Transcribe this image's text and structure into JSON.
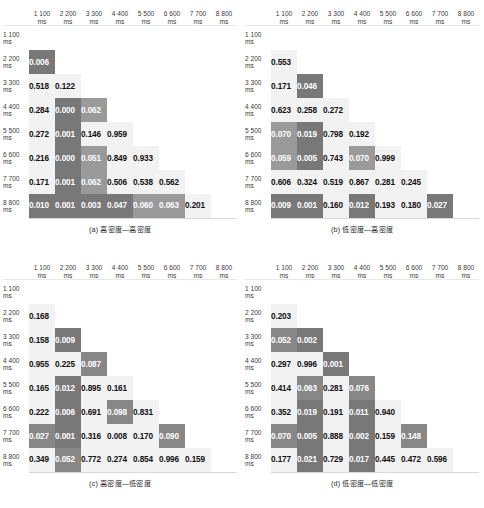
{
  "figure": {
    "type": "multi-panel-heatmap-matrix",
    "panels_count": 4
  },
  "axis": {
    "labels": [
      {
        "num": "1 100",
        "unit": "ms"
      },
      {
        "num": "2 200",
        "unit": "ms"
      },
      {
        "num": "3 300",
        "unit": "ms"
      },
      {
        "num": "4 400",
        "unit": "ms"
      },
      {
        "num": "5 500",
        "unit": "ms"
      },
      {
        "num": "6 600",
        "unit": "ms"
      },
      {
        "num": "7 700",
        "unit": "ms"
      },
      {
        "num": "8 800",
        "unit": "ms"
      }
    ]
  },
  "chart_data": [
    {
      "type": "heatmap",
      "id": "panel-a",
      "title": "(a) 高密度—高密度",
      "xlabel": "",
      "ylabel": "",
      "grid": true,
      "legend": "none",
      "categories": [
        "1 100 ms",
        "2 200 ms",
        "3 300 ms",
        "4 400 ms",
        "5 500 ms",
        "6 600 ms",
        "7 700 ms",
        "8 800 ms"
      ],
      "rows": [
        {
          "label": "1 100 ms",
          "cells": [
            null,
            null,
            null,
            null,
            null,
            null,
            null,
            null
          ]
        },
        {
          "label": "2 200 ms",
          "cells": [
            "0.006",
            null,
            null,
            null,
            null,
            null,
            null,
            null
          ]
        },
        {
          "label": "3 300 ms",
          "cells": [
            "0.518",
            "0.122",
            null,
            null,
            null,
            null,
            null,
            null
          ]
        },
        {
          "label": "4 400 ms",
          "cells": [
            "0.284",
            "0.000",
            "0.062",
            null,
            null,
            null,
            null,
            null
          ]
        },
        {
          "label": "5 500 ms",
          "cells": [
            "0.272",
            "0.001",
            "0.146",
            "0.959",
            null,
            null,
            null,
            null
          ]
        },
        {
          "label": "6 600 ms",
          "cells": [
            "0.216",
            "0.000",
            "0.051",
            "0.849",
            "0.933",
            null,
            null,
            null
          ]
        },
        {
          "label": "7 700 ms",
          "cells": [
            "0.171",
            "0.001",
            "0.062",
            "0.506",
            "0.538",
            "0.562",
            null,
            null
          ]
        },
        {
          "label": "8 800 ms",
          "cells": [
            "0.010",
            "0.001",
            "0.003",
            "0.047",
            "0.060",
            "0.063",
            "0.201",
            null
          ]
        }
      ],
      "shades": [
        [
          0,
          0,
          0,
          0,
          0,
          0,
          0,
          0
        ],
        [
          6,
          0,
          0,
          0,
          0,
          0,
          0,
          0
        ],
        [
          1,
          1,
          0,
          0,
          0,
          0,
          0,
          0
        ],
        [
          1,
          6,
          4,
          0,
          0,
          0,
          0,
          0
        ],
        [
          1,
          6,
          1,
          1,
          0,
          0,
          0,
          0
        ],
        [
          1,
          6,
          4,
          1,
          1,
          0,
          0,
          0
        ],
        [
          1,
          6,
          4,
          1,
          1,
          1,
          0,
          0
        ],
        [
          6,
          6,
          6,
          6,
          4,
          4,
          1,
          0
        ]
      ]
    },
    {
      "type": "heatmap",
      "id": "panel-b",
      "title": "(b) 低密度—高密度",
      "xlabel": "",
      "ylabel": "",
      "grid": true,
      "legend": "none",
      "categories": [
        "1 100 ms",
        "2 200 ms",
        "3 300 ms",
        "4 400 ms",
        "5 500 ms",
        "6 600 ms",
        "7 700 ms",
        "8 800 ms"
      ],
      "rows": [
        {
          "label": "1 100 ms",
          "cells": [
            null,
            null,
            null,
            null,
            null,
            null,
            null,
            null
          ]
        },
        {
          "label": "2 200 ms",
          "cells": [
            "0.553",
            null,
            null,
            null,
            null,
            null,
            null,
            null
          ]
        },
        {
          "label": "3 300 ms",
          "cells": [
            "0.171",
            "0.046",
            null,
            null,
            null,
            null,
            null,
            null
          ]
        },
        {
          "label": "4 400 ms",
          "cells": [
            "0.623",
            "0.258",
            "0.272",
            null,
            null,
            null,
            null,
            null
          ]
        },
        {
          "label": "5 500 ms",
          "cells": [
            "0.070",
            "0.019",
            "0.798",
            "0.192",
            null,
            null,
            null,
            null
          ]
        },
        {
          "label": "6 600 ms",
          "cells": [
            "0.059",
            "0.005",
            "0.743",
            "0.070",
            "0.999",
            null,
            null,
            null
          ]
        },
        {
          "label": "7 700 ms",
          "cells": [
            "0.606",
            "0.324",
            "0.519",
            "0.867",
            "0.281",
            "0.245",
            null,
            null
          ]
        },
        {
          "label": "8 800 ms",
          "cells": [
            "0.009",
            "0.001",
            "0.160",
            "0.012",
            "0.193",
            "0.180",
            "0.027",
            null
          ]
        }
      ],
      "shades": [
        [
          0,
          0,
          0,
          0,
          0,
          0,
          0,
          0
        ],
        [
          1,
          0,
          0,
          0,
          0,
          0,
          0,
          0
        ],
        [
          1,
          6,
          0,
          0,
          0,
          0,
          0,
          0
        ],
        [
          1,
          1,
          1,
          0,
          0,
          0,
          0,
          0
        ],
        [
          4,
          6,
          1,
          1,
          0,
          0,
          0,
          0
        ],
        [
          4,
          6,
          1,
          4,
          1,
          0,
          0,
          0
        ],
        [
          1,
          1,
          1,
          1,
          1,
          1,
          0,
          0
        ],
        [
          6,
          6,
          1,
          6,
          1,
          1,
          6,
          0
        ]
      ]
    },
    {
      "type": "heatmap",
      "id": "panel-c",
      "title": "(c) 高密度—低密度",
      "xlabel": "",
      "ylabel": "",
      "grid": true,
      "legend": "none",
      "categories": [
        "1 100 ms",
        "2 200 ms",
        "3 300 ms",
        "4 400 ms",
        "5 500 ms",
        "6 600 ms",
        "7 700 ms",
        "8 800 ms"
      ],
      "rows": [
        {
          "label": "1 100 ms",
          "cells": [
            null,
            null,
            null,
            null,
            null,
            null,
            null,
            null
          ]
        },
        {
          "label": "2 200 ms",
          "cells": [
            "0.168",
            null,
            null,
            null,
            null,
            null,
            null,
            null
          ]
        },
        {
          "label": "3 300 ms",
          "cells": [
            "0.158",
            "0.009",
            null,
            null,
            null,
            null,
            null,
            null
          ]
        },
        {
          "label": "4 400 ms",
          "cells": [
            "0.955",
            "0.225",
            "0.087",
            null,
            null,
            null,
            null,
            null
          ]
        },
        {
          "label": "5 500 ms",
          "cells": [
            "0.165",
            "0.012",
            "0.895",
            "0.161",
            null,
            null,
            null,
            null
          ]
        },
        {
          "label": "6 600 ms",
          "cells": [
            "0.222",
            "0.006",
            "0.691",
            "0.098",
            "0.831",
            null,
            null,
            null
          ]
        },
        {
          "label": "7 700 ms",
          "cells": [
            "0.027",
            "0.001",
            "0.316",
            "0.008",
            "0.170",
            "0.090",
            null,
            null
          ]
        },
        {
          "label": "8 800 ms",
          "cells": [
            "0.349",
            "0.052",
            "0.772",
            "0.274",
            "0.854",
            "0.996",
            "0.159",
            null
          ]
        }
      ],
      "shades": [
        [
          0,
          0,
          0,
          0,
          0,
          0,
          0,
          0
        ],
        [
          1,
          0,
          0,
          0,
          0,
          0,
          0,
          0
        ],
        [
          1,
          6,
          0,
          0,
          0,
          0,
          0,
          0
        ],
        [
          1,
          1,
          5,
          0,
          0,
          0,
          0,
          0
        ],
        [
          1,
          6,
          1,
          1,
          0,
          0,
          0,
          0
        ],
        [
          1,
          6,
          1,
          5,
          1,
          0,
          0,
          0
        ],
        [
          5,
          6,
          1,
          1,
          1,
          5,
          0,
          0
        ],
        [
          1,
          5,
          1,
          1,
          1,
          1,
          1,
          0
        ]
      ]
    },
    {
      "type": "heatmap",
      "id": "panel-d",
      "title": "(d) 低密度—低密度",
      "xlabel": "",
      "ylabel": "",
      "grid": true,
      "legend": "none",
      "categories": [
        "1 100 ms",
        "2 200 ms",
        "3 300 ms",
        "4 400 ms",
        "5 500 ms",
        "6 600 ms",
        "7 700 ms",
        "8 800 ms"
      ],
      "rows": [
        {
          "label": "1 100 ms",
          "cells": [
            null,
            null,
            null,
            null,
            null,
            null,
            null,
            null
          ]
        },
        {
          "label": "2 200 ms",
          "cells": [
            "0.203",
            null,
            null,
            null,
            null,
            null,
            null,
            null
          ]
        },
        {
          "label": "3 300 ms",
          "cells": [
            "0.052",
            "0.002",
            null,
            null,
            null,
            null,
            null,
            null
          ]
        },
        {
          "label": "4 400 ms",
          "cells": [
            "0.297",
            "0.996",
            "0.001",
            null,
            null,
            null,
            null,
            null
          ]
        },
        {
          "label": "5 500 ms",
          "cells": [
            "0.414",
            "0.063",
            "0.281",
            "0.076",
            null,
            null,
            null,
            null
          ]
        },
        {
          "label": "6 600 ms",
          "cells": [
            "0.352",
            "0.019",
            "0.191",
            "0.011",
            "0.940",
            null,
            null,
            null
          ]
        },
        {
          "label": "7 700 ms",
          "cells": [
            "0.070",
            "0.005",
            "0.888",
            "0.002",
            "0.159",
            "0.148",
            null,
            null
          ]
        },
        {
          "label": "8 800 ms",
          "cells": [
            "0.177",
            "0.021",
            "0.729",
            "0.017",
            "0.445",
            "0.472",
            "0.596",
            null
          ]
        }
      ],
      "shades": [
        [
          0,
          0,
          0,
          0,
          0,
          0,
          0,
          0
        ],
        [
          1,
          0,
          0,
          0,
          0,
          0,
          0,
          0
        ],
        [
          5,
          6,
          0,
          0,
          0,
          0,
          0,
          0
        ],
        [
          1,
          1,
          6,
          0,
          0,
          0,
          0,
          0
        ],
        [
          1,
          5,
          1,
          5,
          0,
          0,
          0,
          0
        ],
        [
          1,
          6,
          1,
          6,
          1,
          0,
          0,
          0
        ],
        [
          5,
          6,
          1,
          6,
          1,
          5,
          0,
          0
        ],
        [
          1,
          6,
          1,
          6,
          1,
          1,
          1,
          0
        ]
      ]
    }
  ]
}
